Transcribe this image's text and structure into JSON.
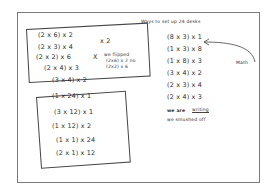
{
  "title": "Ways to set up 24 desks",
  "left_group_top": {
    "items": [
      {
        "expr": "(2 x 6) x 2"
      },
      {
        "expr": "(2 x 3) x 4",
        "note": "x 2"
      },
      {
        "expr": "(2 x 2) x 6",
        "note": "X"
      },
      {
        "expr": "(2 x 4) x 3"
      },
      {
        "expr": "(3 x 4) x 2"
      }
    ],
    "side_note": [
      "we flipped",
      "(2x6) x 2 no",
      "(2x2) x 6"
    ]
  },
  "left_group_bottom": {
    "items": [
      {
        "expr": "(1 x 24) x 1"
      },
      {
        "expr": "(3 x 12) x 1"
      },
      {
        "expr": "(1 x 12) x 2"
      },
      {
        "expr": "(1 x 1) x 24"
      },
      {
        "expr": "(2 x 1) x 12"
      }
    ]
  },
  "right_group": {
    "items": [
      {
        "expr": "(8 x 3) x 1"
      },
      {
        "expr": "(1 x 3) x 8"
      },
      {
        "expr": "(1 x 8) x 3"
      },
      {
        "expr": "(3 x 4) x 2"
      },
      {
        "expr": "(2 x 3) x 4"
      },
      {
        "expr": "(2 x 4) x 3"
      }
    ],
    "arrow_label": "Math",
    "footer_strike": "we are",
    "footer_word": "writing",
    "footer_line2": "we smushed off"
  }
}
